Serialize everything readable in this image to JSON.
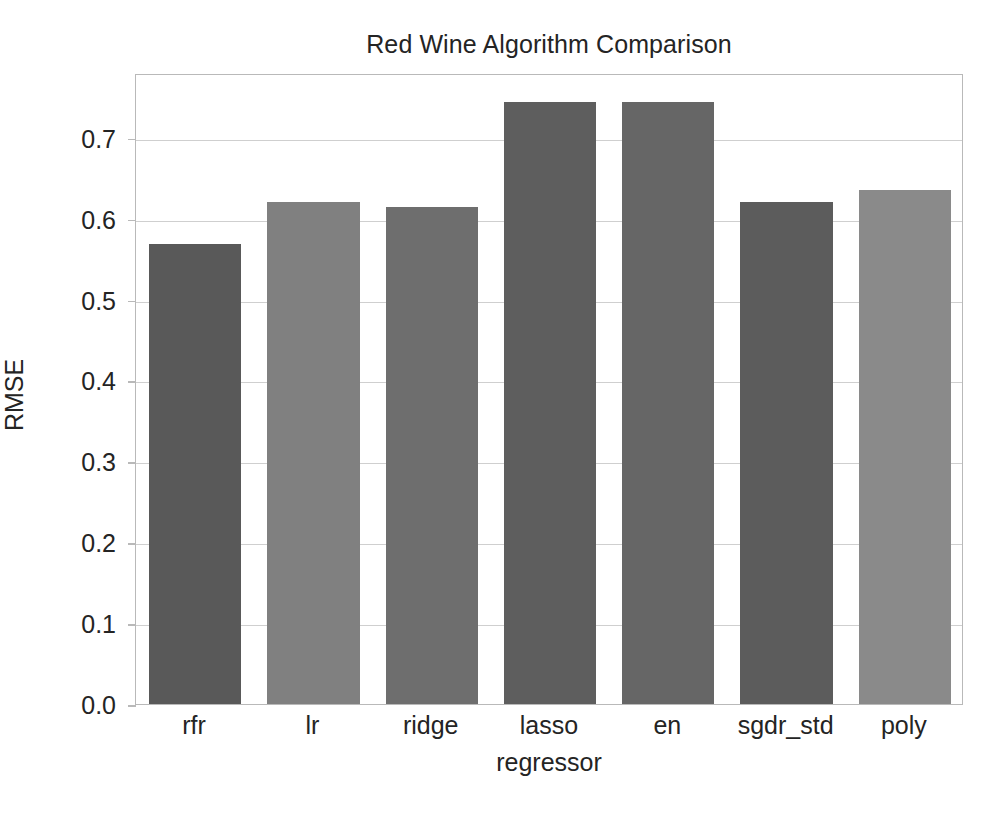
{
  "chart_data": {
    "type": "bar",
    "title": "Red Wine Algorithm Comparison",
    "xlabel": "regressor",
    "ylabel": "RMSE",
    "categories": [
      "rfr",
      "lr",
      "ridge",
      "lasso",
      "en",
      "sgdr_std",
      "poly"
    ],
    "values": [
      0.569,
      0.621,
      0.614,
      0.744,
      0.744,
      0.621,
      0.635
    ],
    "bar_colors": [
      "#595959",
      "#808080",
      "#6e6e6e",
      "#5e5e5e",
      "#666666",
      "#5c5c5c",
      "#8a8a8a"
    ],
    "ylim": [
      0.0,
      0.78
    ],
    "ytick_labels": [
      "0.0",
      "0.1",
      "0.2",
      "0.3",
      "0.4",
      "0.5",
      "0.6",
      "0.7"
    ],
    "ytick_values": [
      0.0,
      0.1,
      0.2,
      0.3,
      0.4,
      0.5,
      0.6,
      0.7
    ],
    "grid": true,
    "grid_axis": "y",
    "legend": "none",
    "bar_width_fraction": 0.78,
    "frame_color": "#b9b9b9",
    "gridline_color": "#cfcfcf",
    "background_color": "#ffffff",
    "text_color": "#242424"
  }
}
